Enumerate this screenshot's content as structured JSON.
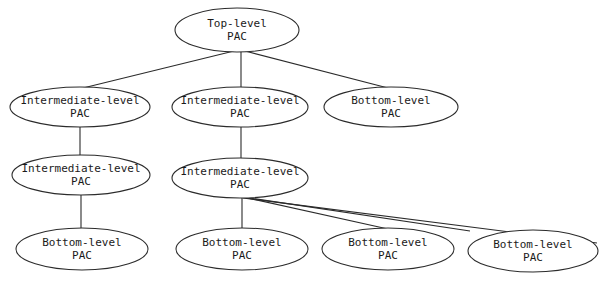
{
  "diagram": {
    "background_color": "#ffffff",
    "stroke_color": "#2b2b2b",
    "text_color": "#1a1a1a",
    "nodes": [
      {
        "id": "n1",
        "line1": "Top-level",
        "line2": "PAC",
        "cx": 237,
        "cy": 30,
        "rx": 62,
        "ry": 22
      },
      {
        "id": "n2",
        "line1": "Intermediate-level",
        "line2": "PAC",
        "cx": 80,
        "cy": 107,
        "rx": 70,
        "ry": 20
      },
      {
        "id": "n3",
        "line1": "Intermediate-level",
        "line2": "PAC",
        "cx": 240,
        "cy": 107,
        "rx": 68,
        "ry": 20
      },
      {
        "id": "n4",
        "line1": "Bottom-level",
        "line2": "PAC",
        "cx": 391,
        "cy": 107,
        "rx": 67,
        "ry": 20
      },
      {
        "id": "n5",
        "line1": "Intermediate-level",
        "line2": "PAC",
        "cx": 81,
        "cy": 175,
        "rx": 69,
        "ry": 20
      },
      {
        "id": "n6",
        "line1": "Intermediate-level",
        "line2": "PAC",
        "cx": 240,
        "cy": 178,
        "rx": 68,
        "ry": 20
      },
      {
        "id": "n7",
        "line1": "Bottom-level",
        "line2": "PAC",
        "cx": 82,
        "cy": 249,
        "rx": 66,
        "ry": 21
      },
      {
        "id": "n8",
        "line1": "Bottom-level",
        "line2": "PAC",
        "cx": 242,
        "cy": 249,
        "rx": 66,
        "ry": 21
      },
      {
        "id": "n9",
        "line1": "Bottom-level",
        "line2": "PAC",
        "cx": 388,
        "cy": 249,
        "rx": 66,
        "ry": 21
      },
      {
        "id": "n10",
        "line1": "Bottom-level",
        "line2": "PAC",
        "cx": 533,
        "cy": 251,
        "rx": 65,
        "ry": 21
      }
    ],
    "edges": [
      {
        "id": "e1",
        "from": "n1",
        "to": "n2",
        "x1": 234,
        "y1": 51,
        "x2": 83,
        "y2": 88
      },
      {
        "id": "e2",
        "from": "n1",
        "to": "n3",
        "x1": 241,
        "y1": 51,
        "x2": 241,
        "y2": 88
      },
      {
        "id": "e3",
        "from": "n1",
        "to": "n4",
        "x1": 245,
        "y1": 51,
        "x2": 388,
        "y2": 88
      },
      {
        "id": "e4",
        "from": "n2",
        "to": "n5",
        "x1": 80,
        "y1": 127,
        "x2": 80,
        "y2": 156
      },
      {
        "id": "e5",
        "from": "n3",
        "to": "n6",
        "x1": 241,
        "y1": 127,
        "x2": 241,
        "y2": 159
      },
      {
        "id": "e6",
        "from": "n5",
        "to": "n7",
        "x1": 81,
        "y1": 195,
        "x2": 81,
        "y2": 229
      },
      {
        "id": "e7",
        "from": "n6",
        "to": "n8",
        "x1": 242,
        "y1": 197,
        "x2": 242,
        "y2": 229
      },
      {
        "id": "e8",
        "from": "n6",
        "to": "n9",
        "x1": 243,
        "y1": 197,
        "x2": 388,
        "y2": 229
      },
      {
        "id": "e9",
        "from": "n6",
        "to": "n10",
        "x1": 243,
        "y1": 197,
        "x2": 470,
        "y2": 231
      },
      {
        "id": "e10",
        "from": "n6",
        "to": "n10",
        "x1": 243,
        "y1": 198,
        "x2": 597,
        "y2": 243
      }
    ]
  }
}
